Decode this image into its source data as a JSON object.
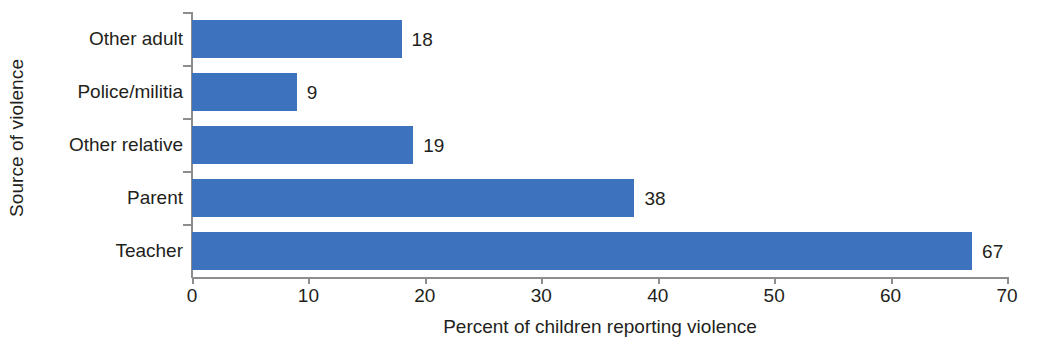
{
  "chart_data": {
    "type": "bar",
    "orientation": "horizontal",
    "title": "",
    "categories": [
      "Other adult",
      "Police/militia",
      "Other relative",
      "Parent",
      "Teacher"
    ],
    "values": [
      18,
      9,
      19,
      38,
      67
    ],
    "data_labels": [
      "18",
      "9",
      "19",
      "38",
      "67"
    ],
    "xlabel": "Percent of children reporting violence",
    "ylabel": "Source of violence",
    "xlim": [
      0,
      70
    ],
    "xticks": [
      0,
      10,
      20,
      30,
      40,
      50,
      60,
      70
    ],
    "xtick_labels": [
      "0",
      "10",
      "20",
      "30",
      "40",
      "50",
      "60",
      "70"
    ],
    "grid": false,
    "legend": null,
    "colors": {
      "bar": "#3d72bf",
      "axis": "#8d8d8d",
      "text": "#231f20",
      "background": "#ffffff"
    }
  }
}
